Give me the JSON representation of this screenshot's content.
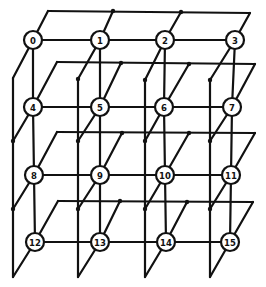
{
  "diagram": {
    "type": "4x4 processor mesh with wraparound (3D perspective)",
    "colors": {
      "line": "#111111",
      "background": "#ffffff",
      "node_fill": "#ffffff"
    },
    "node_radius": 9,
    "nodes": [
      {
        "id": "0",
        "x": 33,
        "y": 40
      },
      {
        "id": "1",
        "x": 100,
        "y": 40
      },
      {
        "id": "2",
        "x": 165,
        "y": 40
      },
      {
        "id": "3",
        "x": 235,
        "y": 40
      },
      {
        "id": "4",
        "x": 33,
        "y": 107
      },
      {
        "id": "5",
        "x": 100,
        "y": 107
      },
      {
        "id": "6",
        "x": 164,
        "y": 107
      },
      {
        "id": "7",
        "x": 232,
        "y": 107
      },
      {
        "id": "8",
        "x": 34,
        "y": 175
      },
      {
        "id": "9",
        "x": 100,
        "y": 175
      },
      {
        "id": "10",
        "x": 165,
        "y": 175
      },
      {
        "id": "11",
        "x": 231,
        "y": 175
      },
      {
        "id": "12",
        "x": 35,
        "y": 242
      },
      {
        "id": "13",
        "x": 100,
        "y": 242
      },
      {
        "id": "14",
        "x": 166,
        "y": 242
      },
      {
        "id": "15",
        "x": 230,
        "y": 242
      }
    ],
    "planes": [
      {
        "top_left": [
          48,
          11
        ],
        "top_right": [
          250,
          13
        ],
        "dots": [
          [
            113,
            11
          ],
          [
            181,
            12
          ]
        ]
      },
      {
        "top_left": [
          57,
          62
        ],
        "top_right": [
          255,
          64
        ],
        "dots": [
          [
            121,
            63
          ],
          [
            189,
            64
          ]
        ]
      },
      {
        "top_left": [
          57,
          132
        ],
        "top_right": [
          255,
          133
        ],
        "dots": [
          [
            122,
            133
          ],
          [
            189,
            133
          ]
        ]
      },
      {
        "top_left": [
          58,
          201
        ],
        "top_right": [
          253,
          202
        ],
        "dots": [
          [
            120,
            201
          ],
          [
            187,
            202
          ]
        ]
      }
    ],
    "back_columns": [
      {
        "x": 13,
        "top": 78,
        "bottom": 277,
        "dots": [
          141,
          209
        ]
      },
      {
        "x": 78,
        "top": 79,
        "bottom": 277,
        "dots": [
          141,
          209
        ]
      },
      {
        "x": 145,
        "top": 80,
        "bottom": 277,
        "dots": [
          141,
          209
        ]
      },
      {
        "x": 210,
        "top": 80,
        "bottom": 277,
        "dots": [
          141,
          209
        ]
      }
    ]
  }
}
